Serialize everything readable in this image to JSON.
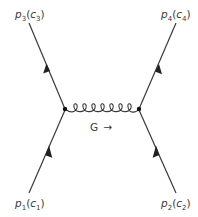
{
  "diagram": {
    "type": "feynman-diagram",
    "colors": {
      "line": "#3a3a3a",
      "text": "#3a3a3a",
      "vertex": "#111111"
    },
    "external_legs": [
      {
        "id": "p1",
        "position": "bottom-left",
        "momentum": "p",
        "momentum_index": "1",
        "color": "c",
        "color_index": "1",
        "arrow_direction": "toward-vertex"
      },
      {
        "id": "p2",
        "position": "bottom-right",
        "momentum": "p",
        "momentum_index": "2",
        "color": "c",
        "color_index": "2",
        "arrow_direction": "toward-vertex"
      },
      {
        "id": "p3",
        "position": "top-left",
        "momentum": "p",
        "momentum_index": "3",
        "color": "c",
        "color_index": "3",
        "arrow_direction": "away-from-vertex"
      },
      {
        "id": "p4",
        "position": "top-right",
        "momentum": "p",
        "momentum_index": "4",
        "color": "c",
        "color_index": "4",
        "arrow_direction": "away-from-vertex"
      }
    ],
    "vertices": [
      {
        "id": "left-vertex"
      },
      {
        "id": "right-vertex"
      }
    ],
    "propagator": {
      "type": "gluon",
      "label": "G",
      "arrow": "→",
      "loops": 7
    },
    "labels": {
      "p1": {
        "main": "p",
        "sub1": "1",
        "paren_open": "(",
        "c": "c",
        "sub2": "1",
        "paren_close": ")"
      },
      "p2": {
        "main": "p",
        "sub1": "2",
        "paren_open": "(",
        "c": "c",
        "sub2": "2",
        "paren_close": ")"
      },
      "p3": {
        "main": "p",
        "sub1": "3",
        "paren_open": "(",
        "c": "c",
        "sub2": "3",
        "paren_close": ")"
      },
      "p4": {
        "main": "p",
        "sub1": "4",
        "paren_open": "(",
        "c": "c",
        "sub2": "4",
        "paren_close": ")"
      },
      "gluon": {
        "text": "G",
        "arrow": "→"
      }
    }
  }
}
